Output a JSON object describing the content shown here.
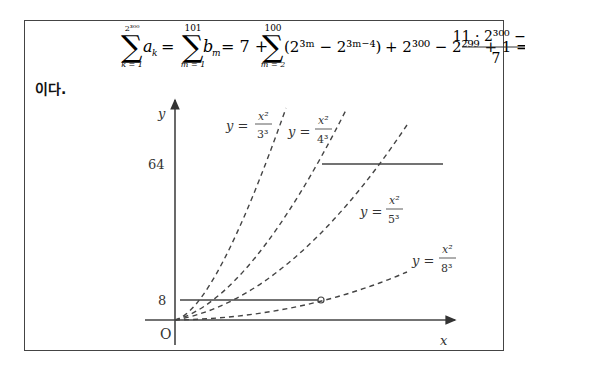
{
  "formula": {
    "sum1": {
      "upper": "2³⁰⁰",
      "lower": "k = 1",
      "term": "a",
      "sub": "k"
    },
    "eq1": "=",
    "sum2": {
      "upper": "101",
      "lower": "m = 1",
      "term": "b",
      "sub": "m"
    },
    "eq2": "= 7 +",
    "sum3": {
      "upper": "100",
      "lower": "m = 2"
    },
    "paren_expr": "(2³ᵐ − 2³ᵐ⁻⁴)",
    "tail": "+ 2³⁰⁰ − 2²⁹⁹ + 1 =",
    "fraction": {
      "numerator": "11 · 2³⁰⁰ − 4",
      "denominator": "7"
    }
  },
  "conclusion": "이다.",
  "graph": {
    "axis_labels": {
      "x": "x",
      "y": "y",
      "origin": "O"
    },
    "y_ticks": [
      {
        "label": "64",
        "value": 64
      },
      {
        "label": "8",
        "value": 8
      }
    ],
    "curves": [
      {
        "label_lhs": "y =",
        "num": "x²",
        "den": "3³",
        "equation": "y = x^2/3^3"
      },
      {
        "label_lhs": "y =",
        "num": "x²",
        "den": "4³",
        "equation": "y = x^2/4^3"
      },
      {
        "label_lhs": "y =",
        "num": "x²",
        "den": "5³",
        "equation": "y = x^2/5^3"
      },
      {
        "label_lhs": "y =",
        "num": "x²",
        "den": "8³",
        "equation": "y = x^2/8^3"
      }
    ],
    "horizontal_segments": [
      {
        "y": 64,
        "from": "curve y=x^2/4^3",
        "to": "right",
        "style": "solid"
      },
      {
        "y": 8,
        "from": "y-axis",
        "to": "curve y=x^2/8^3",
        "end": "open-circle",
        "style": "solid"
      }
    ]
  }
}
